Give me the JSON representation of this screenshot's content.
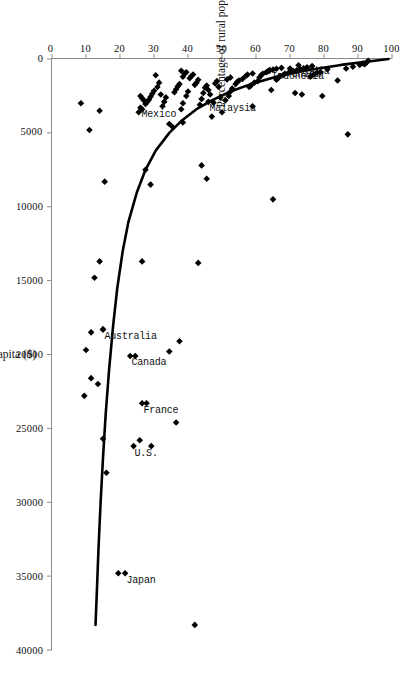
{
  "chart_data": {
    "type": "scatter",
    "title": "",
    "xlabel": "GNP per capita ($)",
    "ylabel": "Percentage of rural population ( Rural)",
    "xlim": [
      0,
      40000
    ],
    "ylim": [
      0,
      100
    ],
    "xticks": [
      0,
      5000,
      10000,
      15000,
      20000,
      25000,
      30000,
      35000,
      40000
    ],
    "xtick_labels": [
      "0",
      "5000",
      "10000",
      "15000",
      "20000",
      "25000",
      "30000",
      "35000",
      "40000"
    ],
    "yticks": [
      0,
      10,
      20,
      30,
      40,
      50,
      60,
      70,
      80,
      90,
      100
    ],
    "ytick_labels": [
      "0",
      "10",
      "20",
      "30",
      "40",
      "50",
      "60",
      "70",
      "80",
      "90",
      "100"
    ],
    "grid": false,
    "legend": false,
    "orientation": "rotated-90-clockwise",
    "marker": "diamond",
    "marker_color": "#000000",
    "curve_color": "#000000",
    "curve_label": "fitted exponential trend",
    "annotations": [
      {
        "label": "Japan",
        "x": 34800,
        "y": 21.5
      },
      {
        "label": "U.S.",
        "x": 26200,
        "y": 24.0
      },
      {
        "label": "France",
        "x": 23300,
        "y": 26.5
      },
      {
        "label": "Canada",
        "x": 20100,
        "y": 23.0
      },
      {
        "label": "Australia",
        "x": 18300,
        "y": 15.0
      },
      {
        "label": "Mexico",
        "x": 3300,
        "y": 26.0
      },
      {
        "label": "Malaysia",
        "x": 2900,
        "y": 46.0
      },
      {
        "label": "Indonesia",
        "x": 750,
        "y": 64.0
      },
      {
        "label": "China",
        "x": 640,
        "y": 70.0
      },
      {
        "label": "India",
        "x": 420,
        "y": 72.5
      }
    ],
    "points": [
      {
        "x": 120,
        "y": 93.0
      },
      {
        "x": 230,
        "y": 92.5
      },
      {
        "x": 300,
        "y": 91.5
      },
      {
        "x": 360,
        "y": 92.0
      },
      {
        "x": 410,
        "y": 90.5
      },
      {
        "x": 520,
        "y": 88.5
      },
      {
        "x": 1450,
        "y": 84.0
      },
      {
        "x": 5100,
        "y": 87.0
      },
      {
        "x": 640,
        "y": 86.5
      },
      {
        "x": 700,
        "y": 81.0
      },
      {
        "x": 2500,
        "y": 79.5
      },
      {
        "x": 880,
        "y": 79.0
      },
      {
        "x": 920,
        "y": 78.0
      },
      {
        "x": 1050,
        "y": 77.0
      },
      {
        "x": 1200,
        "y": 76.0
      },
      {
        "x": 480,
        "y": 76.5
      },
      {
        "x": 560,
        "y": 75.0
      },
      {
        "x": 630,
        "y": 74.0
      },
      {
        "x": 2400,
        "y": 73.5
      },
      {
        "x": 2300,
        "y": 71.5
      },
      {
        "x": 700,
        "y": 73.0
      },
      {
        "x": 760,
        "y": 72.0
      },
      {
        "x": 810,
        "y": 71.0
      },
      {
        "x": 880,
        "y": 70.0
      },
      {
        "x": 950,
        "y": 69.5
      },
      {
        "x": 1000,
        "y": 68.5
      },
      {
        "x": 1080,
        "y": 68.0
      },
      {
        "x": 1150,
        "y": 67.0
      },
      {
        "x": 1300,
        "y": 66.5
      },
      {
        "x": 9500,
        "y": 65.0
      },
      {
        "x": 2100,
        "y": 64.5
      },
      {
        "x": 1400,
        "y": 66.0
      },
      {
        "x": 600,
        "y": 67.5
      },
      {
        "x": 660,
        "y": 66.0
      },
      {
        "x": 720,
        "y": 65.0
      },
      {
        "x": 780,
        "y": 64.0
      },
      {
        "x": 840,
        "y": 63.5
      },
      {
        "x": 900,
        "y": 63.0
      },
      {
        "x": 1000,
        "y": 62.0
      },
      {
        "x": 1100,
        "y": 61.5
      },
      {
        "x": 1250,
        "y": 61.0
      },
      {
        "x": 1500,
        "y": 60.5
      },
      {
        "x": 1600,
        "y": 59.5
      },
      {
        "x": 3200,
        "y": 59.0
      },
      {
        "x": 1800,
        "y": 58.5
      },
      {
        "x": 1900,
        "y": 58.0
      },
      {
        "x": 980,
        "y": 59.0
      },
      {
        "x": 1060,
        "y": 57.5
      },
      {
        "x": 1150,
        "y": 57.0
      },
      {
        "x": 1350,
        "y": 56.0
      },
      {
        "x": 1450,
        "y": 55.0
      },
      {
        "x": 1550,
        "y": 54.5
      },
      {
        "x": 1700,
        "y": 54.0
      },
      {
        "x": 2000,
        "y": 53.0
      },
      {
        "x": 2200,
        "y": 52.5
      },
      {
        "x": 2500,
        "y": 52.0
      },
      {
        "x": 2800,
        "y": 51.0
      },
      {
        "x": 1250,
        "y": 52.5
      },
      {
        "x": 1380,
        "y": 51.5
      },
      {
        "x": 3600,
        "y": 50.0
      },
      {
        "x": 2600,
        "y": 49.5
      },
      {
        "x": 1900,
        "y": 49.0
      },
      {
        "x": 1500,
        "y": 48.5
      },
      {
        "x": 1650,
        "y": 48.0
      },
      {
        "x": 2950,
        "y": 47.5
      },
      {
        "x": 3900,
        "y": 47.0
      },
      {
        "x": 2400,
        "y": 46.5
      },
      {
        "x": 2100,
        "y": 46.0
      },
      {
        "x": 1800,
        "y": 45.5
      },
      {
        "x": 1950,
        "y": 45.0
      },
      {
        "x": 2300,
        "y": 44.5
      },
      {
        "x": 2700,
        "y": 44.0
      },
      {
        "x": 3100,
        "y": 43.5
      },
      {
        "x": 7200,
        "y": 44.0
      },
      {
        "x": 8100,
        "y": 45.5
      },
      {
        "x": 13800,
        "y": 43.0
      },
      {
        "x": 24600,
        "y": 36.5
      },
      {
        "x": 38300,
        "y": 42.0
      },
      {
        "x": 1400,
        "y": 43.0
      },
      {
        "x": 1600,
        "y": 42.5
      },
      {
        "x": 1750,
        "y": 42.0
      },
      {
        "x": 1050,
        "y": 41.5
      },
      {
        "x": 1150,
        "y": 41.0
      },
      {
        "x": 1300,
        "y": 40.5
      },
      {
        "x": 2200,
        "y": 40.0
      },
      {
        "x": 2500,
        "y": 39.5
      },
      {
        "x": 900,
        "y": 39.5
      },
      {
        "x": 1000,
        "y": 39.0
      },
      {
        "x": 3000,
        "y": 38.5
      },
      {
        "x": 3400,
        "y": 38.0
      },
      {
        "x": 4300,
        "y": 38.5
      },
      {
        "x": 19100,
        "y": 37.5
      },
      {
        "x": 1700,
        "y": 37.5
      },
      {
        "x": 1850,
        "y": 37.0
      },
      {
        "x": 2050,
        "y": 36.5
      },
      {
        "x": 2250,
        "y": 36.0
      },
      {
        "x": 4600,
        "y": 35.5
      },
      {
        "x": 4400,
        "y": 34.5
      },
      {
        "x": 19800,
        "y": 34.5
      },
      {
        "x": 2600,
        "y": 33.5
      },
      {
        "x": 2900,
        "y": 33.0
      },
      {
        "x": 3200,
        "y": 32.5
      },
      {
        "x": 2400,
        "y": 32.0
      },
      {
        "x": 1600,
        "y": 31.5
      },
      {
        "x": 1900,
        "y": 31.0
      },
      {
        "x": 1100,
        "y": 30.5
      },
      {
        "x": 2150,
        "y": 30.0
      },
      {
        "x": 2350,
        "y": 29.5
      },
      {
        "x": 2550,
        "y": 29.0
      },
      {
        "x": 2750,
        "y": 28.5
      },
      {
        "x": 2900,
        "y": 28.0
      },
      {
        "x": 3050,
        "y": 27.5
      },
      {
        "x": 2800,
        "y": 27.0
      },
      {
        "x": 2650,
        "y": 26.5
      },
      {
        "x": 2500,
        "y": 26.0
      },
      {
        "x": 3400,
        "y": 26.5
      },
      {
        "x": 3600,
        "y": 25.5
      },
      {
        "x": 8500,
        "y": 29.0
      },
      {
        "x": 7500,
        "y": 27.5
      },
      {
        "x": 13700,
        "y": 26.5
      },
      {
        "x": 23300,
        "y": 27.8
      },
      {
        "x": 26200,
        "y": 29.2
      },
      {
        "x": 25800,
        "y": 25.8
      },
      {
        "x": 20100,
        "y": 24.5
      },
      {
        "x": 28000,
        "y": 16.0
      },
      {
        "x": 25700,
        "y": 15.0
      },
      {
        "x": 34800,
        "y": 19.5
      },
      {
        "x": 22000,
        "y": 13.5
      },
      {
        "x": 21600,
        "y": 11.5
      },
      {
        "x": 22800,
        "y": 9.5
      },
      {
        "x": 19700,
        "y": 10.0
      },
      {
        "x": 18300,
        "y": 15.0
      },
      {
        "x": 18500,
        "y": 11.5
      },
      {
        "x": 14800,
        "y": 12.5
      },
      {
        "x": 13700,
        "y": 14.0
      },
      {
        "x": 4800,
        "y": 11.0
      },
      {
        "x": 3500,
        "y": 14.0
      },
      {
        "x": 8300,
        "y": 15.5
      },
      {
        "x": 3000,
        "y": 8.5
      },
      {
        "x": 1200,
        "y": 38.5
      },
      {
        "x": 800,
        "y": 38.0
      }
    ],
    "curve": {
      "description": "exponential fit: rural % declines sharply with rising GNP",
      "points": [
        {
          "x": 0,
          "y": 99.0
        },
        {
          "x": 400,
          "y": 85.0
        },
        {
          "x": 800,
          "y": 74.0
        },
        {
          "x": 1200,
          "y": 66.0
        },
        {
          "x": 1700,
          "y": 58.5
        },
        {
          "x": 2200,
          "y": 52.5
        },
        {
          "x": 2800,
          "y": 47.0
        },
        {
          "x": 3400,
          "y": 42.5
        },
        {
          "x": 4200,
          "y": 38.0
        },
        {
          "x": 5000,
          "y": 34.5
        },
        {
          "x": 6200,
          "y": 30.5
        },
        {
          "x": 7500,
          "y": 27.5
        },
        {
          "x": 9000,
          "y": 25.0
        },
        {
          "x": 11000,
          "y": 22.5
        },
        {
          "x": 13000,
          "y": 20.8
        },
        {
          "x": 15500,
          "y": 19.2
        },
        {
          "x": 18000,
          "y": 18.0
        },
        {
          "x": 21000,
          "y": 16.8
        },
        {
          "x": 24000,
          "y": 15.8
        },
        {
          "x": 27000,
          "y": 15.0
        },
        {
          "x": 30000,
          "y": 14.3
        },
        {
          "x": 33000,
          "y": 13.7
        },
        {
          "x": 36000,
          "y": 13.2
        },
        {
          "x": 38300,
          "y": 12.8
        }
      ]
    }
  }
}
